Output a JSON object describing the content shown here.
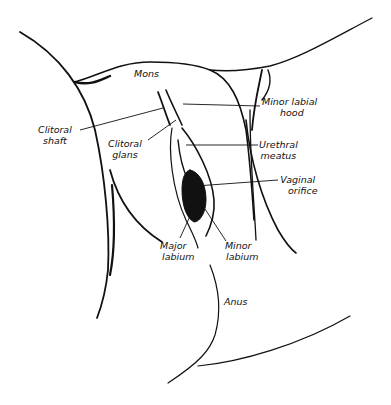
{
  "diagram": {
    "kind": "anatomical line drawing",
    "colors": {
      "ink": "#111111",
      "background": "#ffffff"
    },
    "labels": {
      "mons": "Mons",
      "minor_labial_hood_1": "Minor labial",
      "minor_labial_hood_2": "hood",
      "clitoral_shaft_1": "Clitoral",
      "clitoral_shaft_2": "shaft",
      "clitoral_glans_1": "Clitoral",
      "clitoral_glans_2": "glans",
      "urethral_meatus_1": "Urethral",
      "urethral_meatus_2": "meatus",
      "vaginal_orifice_1": "Vaginal",
      "vaginal_orifice_2": "orifice",
      "major_labium_1": "Major",
      "major_labium_2": "labium",
      "minor_labium_1": "Minor",
      "minor_labium_2": "labium",
      "anus": "Anus"
    }
  }
}
